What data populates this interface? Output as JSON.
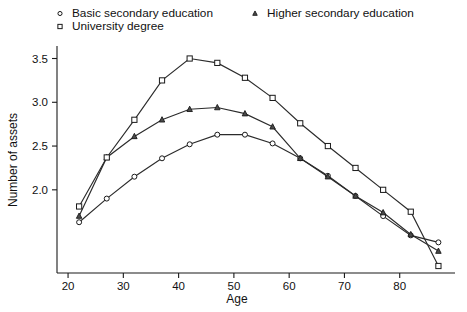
{
  "chart_data": {
    "type": "line",
    "title": "",
    "xlabel": "Age",
    "ylabel": "Number of assets",
    "xlim": [
      18,
      90
    ],
    "ylim": [
      1.05,
      3.62
    ],
    "xticks": [
      20,
      30,
      40,
      50,
      60,
      70,
      80
    ],
    "yticks": [
      2.0,
      2.5,
      3.0,
      3.5
    ],
    "xtick_labels": [
      "20",
      "30",
      "40",
      "50",
      "60",
      "70",
      "80"
    ],
    "ytick_labels": [
      "2.0",
      "2.5",
      "3.0",
      "3.5"
    ],
    "grid": false,
    "legend_position": "top",
    "x": [
      22,
      27,
      32,
      37,
      42,
      47,
      52,
      57,
      62,
      67,
      72,
      77,
      82,
      87
    ],
    "series": [
      {
        "name": "Basic secondary education",
        "marker": "circle",
        "values": [
          1.63,
          1.9,
          2.15,
          2.36,
          2.52,
          2.63,
          2.63,
          2.53,
          2.36,
          2.16,
          1.93,
          1.7,
          1.48,
          1.4
        ]
      },
      {
        "name": "Higher secondary education",
        "marker": "triangle",
        "values": [
          1.7,
          2.37,
          2.61,
          2.8,
          2.92,
          2.94,
          2.87,
          2.72,
          2.36,
          2.15,
          1.93,
          1.74,
          1.49,
          1.3
        ]
      },
      {
        "name": "University degree",
        "marker": "square",
        "values": [
          1.81,
          2.37,
          2.8,
          3.25,
          3.5,
          3.45,
          3.28,
          3.05,
          2.76,
          2.5,
          2.25,
          2.0,
          1.75,
          1.13
        ]
      }
    ]
  },
  "legend": {
    "entries": [
      {
        "label": "Basic secondary education",
        "marker": "circle-marker"
      },
      {
        "label": "Higher secondary education",
        "marker": "triangle-marker"
      },
      {
        "label": "University degree",
        "marker": "square-marker"
      }
    ]
  },
  "axes": {
    "x_title": "Age",
    "y_title": "Number of assets"
  },
  "colors": {
    "line": "#2b2b2b",
    "axis": "#1a1a1a",
    "text": "#111111",
    "background": "#ffffff"
  }
}
